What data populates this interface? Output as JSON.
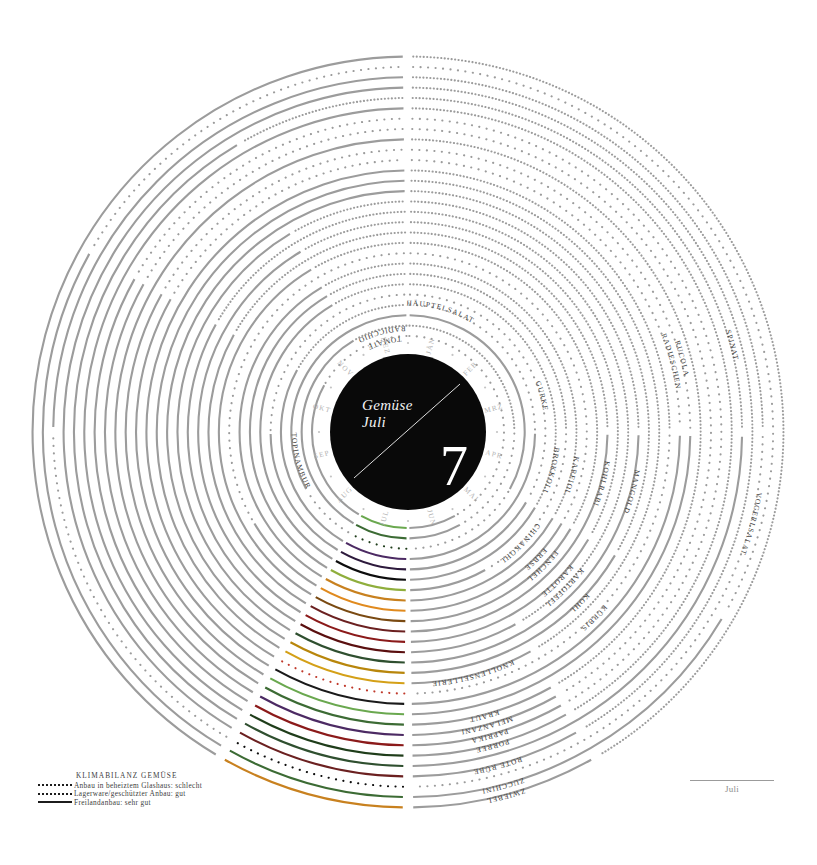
{
  "meta": {
    "poster_title": "Gemüse",
    "poster_subtitle": "Juli",
    "month_number": "7"
  },
  "months": [
    "JÄN",
    "FEB",
    "MRZ",
    "APR",
    "MAI",
    "JUN",
    "JUL",
    "AUG",
    "SEP",
    "OKT",
    "NOV",
    "DEZ"
  ],
  "legend": {
    "title": "KLIMABILANZ GEMÜSE",
    "items": [
      {
        "style": "sparse-dotted",
        "label": "Anbau in beheiztem Glashaus: schlecht"
      },
      {
        "style": "dense-dotted",
        "label": "Lagerware/geschützter Anbau: gut"
      },
      {
        "style": "solid",
        "label": "Freilandanbau: sehr gut"
      }
    ]
  },
  "footer": {
    "label": "Juli"
  },
  "colors": {
    "neutral_arc": "#9c9c9c",
    "hub": "#090909",
    "month_text": "#b2b2b2",
    "label_text": "#3d3d3d",
    "highlight_palette": [
      "#6aa84f",
      "#3c6b34",
      "#1f3d1a",
      "#4c2a63",
      "#2d1a3c",
      "#0d0d0d",
      "#8fae3c",
      "#c8811f",
      "#e08a1e",
      "#7a4a12",
      "#6b2020",
      "#8b1a1a",
      "#5a0f0f",
      "#2f4f2f",
      "#b8860b",
      "#d4a017",
      "#c0392b",
      "#1a1a1a"
    ]
  },
  "chart_data": {
    "type": "radial-seasonality-calendar",
    "highlight_month": "JUL",
    "style_legend": {
      "sparse-dotted": "Anbau in beheiztem Glashaus: schlecht",
      "dense-dotted": "Lagerware/geschützter Anbau: gut",
      "solid": "Freilandanbau: sehr gut"
    },
    "rings": [
      {
        "name": "TOMATE",
        "ring": 1,
        "label_month": "DEZ",
        "color": "#6aa84f",
        "segments": [
          [
            "JÄN",
            "MAI",
            "sparse-dotted"
          ],
          [
            "JUN",
            "OKT",
            "solid"
          ],
          [
            "NOV",
            "DEZ",
            "sparse-dotted"
          ]
        ]
      },
      {
        "name": "RADICCHIO",
        "ring": 2,
        "label_month": "DEZ",
        "color": "#3c6b34",
        "segments": [
          [
            "JÄN",
            "MRZ",
            "dense-dotted"
          ],
          [
            "APR",
            "MAI",
            "sparse-dotted"
          ],
          [
            "JUN",
            "NOV",
            "solid"
          ],
          [
            "DEZ",
            "DEZ",
            "dense-dotted"
          ]
        ]
      },
      {
        "name": "TOPINAMBUR",
        "ring": 3,
        "label_month": "SEP",
        "color": "#1f3d1a",
        "segments": [
          [
            "JÄN",
            "APR",
            "solid"
          ],
          [
            "MAI",
            "AUG",
            "sparse-dotted"
          ],
          [
            "SEP",
            "DEZ",
            "solid"
          ]
        ]
      },
      {
        "name": "HÄUPTELSALAT",
        "ring": 4,
        "label_month": "JÄN",
        "color": "#4c2a63",
        "segments": [
          [
            "JÄN",
            "MRZ",
            "sparse-dotted"
          ],
          [
            "APR",
            "OKT",
            "solid"
          ],
          [
            "NOV",
            "DEZ",
            "dense-dotted"
          ]
        ]
      },
      {
        "name": "GURKE",
        "ring": 5,
        "label_month": "MRZ",
        "color": "#2d1a3c",
        "segments": [
          [
            "JÄN",
            "APR",
            "sparse-dotted"
          ],
          [
            "MAI",
            "SEP",
            "solid"
          ],
          [
            "OKT",
            "DEZ",
            "sparse-dotted"
          ]
        ]
      },
      {
        "name": "BROKKOLI",
        "ring": 6,
        "label_month": "APR",
        "color": "#0d0d0d",
        "segments": [
          [
            "JÄN",
            "APR",
            "dense-dotted"
          ],
          [
            "MAI",
            "NOV",
            "solid"
          ],
          [
            "DEZ",
            "DEZ",
            "dense-dotted"
          ]
        ]
      },
      {
        "name": "CHINAKOHL",
        "ring": 7,
        "label_month": "MAI",
        "color": "#8fae3c",
        "segments": [
          [
            "JÄN",
            "MRZ",
            "dense-dotted"
          ],
          [
            "APR",
            "MAI",
            "sparse-dotted"
          ],
          [
            "JUN",
            "NOV",
            "solid"
          ],
          [
            "DEZ",
            "DEZ",
            "dense-dotted"
          ]
        ]
      },
      {
        "name": "KARFIOL",
        "ring": 8,
        "label_month": "APR",
        "color": "#c8811f",
        "segments": [
          [
            "JÄN",
            "APR",
            "dense-dotted"
          ],
          [
            "MAI",
            "NOV",
            "solid"
          ],
          [
            "DEZ",
            "DEZ",
            "dense-dotted"
          ]
        ]
      },
      {
        "name": "ERBSE",
        "ring": 9,
        "label_month": "MAI",
        "color": "#e08a1e",
        "segments": [
          [
            "JÄN",
            "APR",
            "sparse-dotted"
          ],
          [
            "MAI",
            "AUG",
            "solid"
          ],
          [
            "SEP",
            "DEZ",
            "sparse-dotted"
          ]
        ]
      },
      {
        "name": "FENCHEL",
        "ring": 10,
        "label_month": "MAI",
        "color": "#7a4a12",
        "segments": [
          [
            "JÄN",
            "APR",
            "dense-dotted"
          ],
          [
            "MAI",
            "NOV",
            "solid"
          ],
          [
            "DEZ",
            "DEZ",
            "dense-dotted"
          ]
        ]
      },
      {
        "name": "KOHLRABI",
        "ring": 11,
        "label_month": "APR",
        "color": "#6b2020",
        "segments": [
          [
            "JÄN",
            "MRZ",
            "dense-dotted"
          ],
          [
            "APR",
            "OKT",
            "solid"
          ],
          [
            "NOV",
            "DEZ",
            "dense-dotted"
          ]
        ]
      },
      {
        "name": "KAROTTE",
        "ring": 12,
        "label_month": "MAI",
        "color": "#8b1a1a",
        "segments": [
          [
            "JÄN",
            "APR",
            "dense-dotted"
          ],
          [
            "MAI",
            "NOV",
            "solid"
          ],
          [
            "DEZ",
            "DEZ",
            "dense-dotted"
          ]
        ]
      },
      {
        "name": "KARTOFFEL",
        "ring": 13,
        "label_month": "MAI",
        "color": "#5a0f0f",
        "segments": [
          [
            "JÄN",
            "MAI",
            "dense-dotted"
          ],
          [
            "JUN",
            "OKT",
            "solid"
          ],
          [
            "NOV",
            "DEZ",
            "dense-dotted"
          ]
        ]
      },
      {
        "name": "MANGOLD",
        "ring": 14,
        "label_month": "APR",
        "color": "#2f4f2f",
        "segments": [
          [
            "JÄN",
            "MRZ",
            "dense-dotted"
          ],
          [
            "APR",
            "NOV",
            "solid"
          ],
          [
            "DEZ",
            "DEZ",
            "dense-dotted"
          ]
        ]
      },
      {
        "name": "KOHL",
        "ring": 15,
        "label_month": "MAI",
        "color": "#b8860b",
        "segments": [
          [
            "JÄN",
            "APR",
            "dense-dotted"
          ],
          [
            "MAI",
            "DEZ",
            "solid"
          ]
        ]
      },
      {
        "name": "KNOLLENSELLERIE",
        "ring": 16,
        "label_month": "JUN",
        "color": "#d4a017",
        "segments": [
          [
            "JÄN",
            "MAI",
            "dense-dotted"
          ],
          [
            "JUN",
            "DEZ",
            "solid"
          ]
        ]
      },
      {
        "name": "KÜRBIS",
        "ring": 17,
        "label_month": "MAI",
        "color": "#c0392b",
        "segments": [
          [
            "JÄN",
            "MRZ",
            "dense-dotted"
          ],
          [
            "APR",
            "JUL",
            "sparse-dotted"
          ],
          [
            "AUG",
            "DEZ",
            "solid"
          ]
        ]
      },
      {
        "name": "RADIESCHEN",
        "ring": 18,
        "label_month": "MRZ",
        "color": "#1a1a1a",
        "segments": [
          [
            "JÄN",
            "MRZ",
            "sparse-dotted"
          ],
          [
            "APR",
            "OKT",
            "solid"
          ],
          [
            "NOV",
            "DEZ",
            "sparse-dotted"
          ]
        ]
      },
      {
        "name": "RUCOLA",
        "ring": 19,
        "label_month": "MRZ",
        "color": "#6aa84f",
        "segments": [
          [
            "JÄN",
            "MRZ",
            "sparse-dotted"
          ],
          [
            "APR",
            "OKT",
            "solid"
          ],
          [
            "NOV",
            "DEZ",
            "sparse-dotted"
          ]
        ]
      },
      {
        "name": "KRAUT",
        "ring": 20,
        "label_month": "JUN",
        "color": "#3c6b34",
        "segments": [
          [
            "JÄN",
            "MAI",
            "dense-dotted"
          ],
          [
            "JUN",
            "DEZ",
            "solid"
          ]
        ]
      },
      {
        "name": "MELANZANI",
        "ring": 21,
        "label_month": "JUN",
        "color": "#4c2a63",
        "segments": [
          [
            "JÄN",
            "MAI",
            "sparse-dotted"
          ],
          [
            "JUN",
            "OKT",
            "solid"
          ],
          [
            "NOV",
            "DEZ",
            "sparse-dotted"
          ]
        ]
      },
      {
        "name": "PAPRIKA",
        "ring": 22,
        "label_month": "JUN",
        "color": "#8b1a1a",
        "segments": [
          [
            "JÄN",
            "MAI",
            "sparse-dotted"
          ],
          [
            "JUN",
            "OKT",
            "solid"
          ],
          [
            "NOV",
            "DEZ",
            "sparse-dotted"
          ]
        ]
      },
      {
        "name": "PORREE",
        "ring": 23,
        "label_month": "JUN",
        "color": "#1f3d1a",
        "segments": [
          [
            "JÄN",
            "MAI",
            "dense-dotted"
          ],
          [
            "JUN",
            "DEZ",
            "solid"
          ]
        ]
      },
      {
        "name": "SPINAT",
        "ring": 24,
        "label_month": "MRZ",
        "color": "#2f4f2f",
        "segments": [
          [
            "JÄN",
            "MRZ",
            "dense-dotted"
          ],
          [
            "APR",
            "NOV",
            "solid"
          ],
          [
            "DEZ",
            "DEZ",
            "dense-dotted"
          ]
        ]
      },
      {
        "name": "ROTE RÜBE",
        "ring": 25,
        "label_month": "JUN",
        "color": "#6b2020",
        "segments": [
          [
            "JÄN",
            "MAI",
            "dense-dotted"
          ],
          [
            "JUN",
            "DEZ",
            "solid"
          ]
        ]
      },
      {
        "name": "VOGERLSALAT",
        "ring": 26,
        "label_month": "APR",
        "color": "#0d0d0d",
        "segments": [
          [
            "JÄN",
            "MRZ",
            "dense-dotted"
          ],
          [
            "APR",
            "SEP",
            "sparse-dotted"
          ],
          [
            "OKT",
            "DEZ",
            "solid"
          ]
        ]
      },
      {
        "name": "ZUCCHINI",
        "ring": 27,
        "label_month": "JUN",
        "color": "#3c6b34",
        "segments": [
          [
            "JÄN",
            "APR",
            "sparse-dotted"
          ],
          [
            "MAI",
            "OKT",
            "solid"
          ],
          [
            "NOV",
            "DEZ",
            "sparse-dotted"
          ]
        ]
      },
      {
        "name": "ZWIEBEL",
        "ring": 28,
        "label_month": "JUN",
        "color": "#c8811f",
        "segments": [
          [
            "JÄN",
            "MAI",
            "dense-dotted"
          ],
          [
            "JUN",
            "DEZ",
            "solid"
          ]
        ]
      }
    ]
  }
}
